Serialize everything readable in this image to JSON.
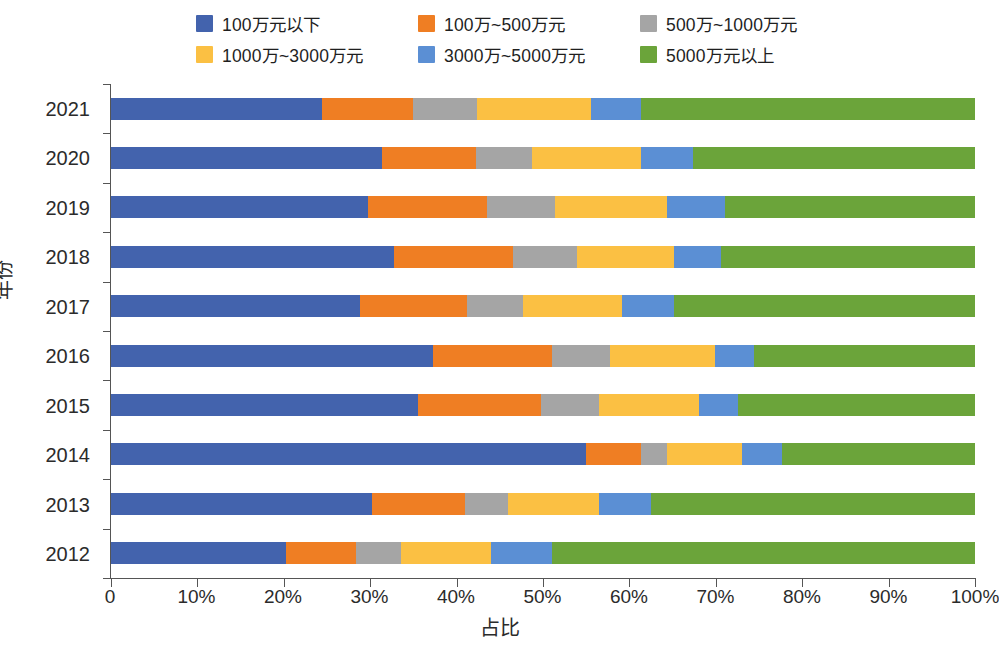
{
  "chart_data": {
    "type": "bar",
    "orientation": "horizontal",
    "stacked": true,
    "normalized": true,
    "title": "",
    "xlabel": "占比",
    "ylabel": "年份",
    "xlim": [
      0,
      100
    ],
    "grid": false,
    "legend_position": "top",
    "x_ticklabels": [
      "0",
      "10%",
      "20%",
      "30%",
      "40%",
      "50%",
      "60%",
      "70%",
      "80%",
      "90%",
      "100%"
    ],
    "x_tickvalues": [
      0,
      10,
      20,
      30,
      40,
      50,
      60,
      70,
      80,
      90,
      100
    ],
    "categories": [
      "2021",
      "2020",
      "2019",
      "2018",
      "2017",
      "2016",
      "2015",
      "2014",
      "2013",
      "2012"
    ],
    "series": [
      {
        "name": "100万元以下",
        "color": "#4363ad",
        "values": [
          24.4,
          31.4,
          29.8,
          32.8,
          28.8,
          37.3,
          35.5,
          55.0,
          30.2,
          20.3
        ]
      },
      {
        "name": "100万~500万元",
        "color": "#ef7e23",
        "values": [
          10.5,
          10.8,
          13.7,
          13.7,
          12.4,
          13.7,
          14.3,
          6.3,
          10.8,
          8.0
        ]
      },
      {
        "name": "500万~1000万元",
        "color": "#a5a5a5",
        "values": [
          7.5,
          6.5,
          7.9,
          7.4,
          6.5,
          6.7,
          6.7,
          3.1,
          5.0,
          5.3
        ]
      },
      {
        "name": "1000万~3000万元",
        "color": "#fbc043",
        "values": [
          13.2,
          12.6,
          12.9,
          11.3,
          11.5,
          12.2,
          11.6,
          8.6,
          10.5,
          10.4
        ]
      },
      {
        "name": "3000万~5000万元",
        "color": "#5b8fd4",
        "values": [
          5.8,
          6.1,
          6.8,
          5.4,
          6.0,
          4.5,
          4.5,
          4.7,
          6.0,
          7.0
        ]
      },
      {
        "name": "5000万元以上",
        "color": "#6ba43a",
        "values": [
          38.6,
          32.6,
          28.9,
          29.4,
          34.8,
          25.6,
          27.4,
          22.3,
          37.5,
          49.0
        ]
      }
    ]
  }
}
